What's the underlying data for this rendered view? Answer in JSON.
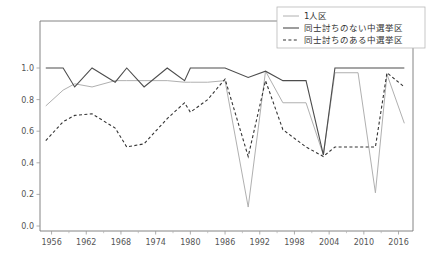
{
  "chart_data": {
    "type": "line",
    "title": "",
    "xlabel": "",
    "ylabel": "",
    "xlim": [
      1954.0,
      1918.0
    ],
    "xlim_actual": [
      1954.0,
      2018.5
    ],
    "ylim": [
      0.0,
      1.05
    ],
    "grid": false,
    "legend_position": "upper right",
    "xticks": [
      1956,
      1962,
      1968,
      1974,
      1980,
      1986,
      1992,
      1998,
      2004,
      2010,
      2016
    ],
    "xtick_labels": [
      "1956",
      "1962",
      "1968",
      "1974",
      "1980",
      "1986",
      "1992",
      "1998",
      "2004",
      "2010",
      "2016"
    ],
    "xminorticks": [
      1959,
      1965,
      1971,
      1977,
      1983,
      1989,
      1995,
      2001,
      2007,
      2013
    ],
    "yticks": [
      0.0,
      0.2,
      0.4,
      0.6,
      0.8,
      1.0
    ],
    "ytick_labels": [
      "0.0",
      "0.2",
      "0.4",
      "0.6",
      "0.8",
      "1.0"
    ],
    "x": [
      1955,
      1958,
      1960,
      1963,
      1967,
      1969,
      1972,
      1976,
      1979,
      1980,
      1983,
      1986,
      1990,
      1993,
      1996,
      2000,
      2003,
      2005,
      2009,
      2012,
      2014,
      2017
    ],
    "series": [
      {
        "name": "1人区",
        "label": "1人区",
        "color": "#b0b0b0",
        "linestyle": "solid",
        "linewidth": 1.0,
        "values": [
          0.76,
          0.86,
          0.9,
          0.88,
          0.92,
          0.92,
          0.92,
          0.92,
          0.91,
          0.91,
          0.91,
          0.92,
          0.12,
          0.98,
          0.78,
          0.78,
          0.45,
          0.97,
          0.97,
          0.21,
          0.96,
          0.65
        ]
      },
      {
        "name": "同士討ちのない中選挙区",
        "label": "同士討ちのない中選挙区",
        "color": "#4d4d4d",
        "linestyle": "solid",
        "linewidth": 1.1,
        "values": [
          1.0,
          1.0,
          0.88,
          1.0,
          0.91,
          1.0,
          0.88,
          1.0,
          0.92,
          1.0,
          1.0,
          1.0,
          0.94,
          0.98,
          0.92,
          0.92,
          0.45,
          1.0,
          1.0,
          1.0,
          1.0,
          1.0
        ]
      },
      {
        "name": "同士討ちのある中選挙区",
        "label": "同士討ちのある中選挙区",
        "color": "#333333",
        "linestyle": "dashed",
        "linewidth": 1.1,
        "values": [
          0.54,
          0.66,
          0.7,
          0.71,
          0.62,
          0.5,
          0.52,
          0.68,
          0.78,
          0.72,
          0.8,
          0.93,
          0.44,
          0.92,
          0.61,
          0.5,
          0.44,
          0.5,
          0.5,
          0.5,
          0.97,
          0.88
        ]
      }
    ]
  }
}
